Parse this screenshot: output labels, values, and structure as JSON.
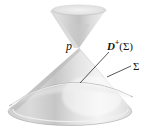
{
  "figure": {
    "type": "spacetime-light-cone",
    "background_color": "#ffffff",
    "width": 156,
    "height": 131
  },
  "labels": {
    "apex_point": "p",
    "domain_of_dependence": {
      "symbol": "D",
      "superscript": "+",
      "open_paren": "(",
      "argument": "Σ",
      "close_paren": ")",
      "full": "D+(Σ)"
    },
    "hypersurface": "Σ"
  },
  "geometry": {
    "apex": {
      "x": 79,
      "y": 48
    },
    "upper_cone": {
      "rim_center_x": 79,
      "rim_center_y": 10,
      "rim_rx": 27,
      "rim_ry": 5
    },
    "lower_cone": {
      "base_center_x": 70,
      "base_center_y": 112,
      "base_rx": 62,
      "base_ry": 14
    },
    "sigma_curve_note": "arc across lower cone interior"
  },
  "leader_lines": {
    "dplus_line": {
      "x1": 109,
      "y1": 52,
      "x2": 80,
      "y2": 83
    },
    "sigma_line": {
      "x1": 131,
      "y1": 66,
      "x2": 108,
      "y2": 77
    }
  },
  "colors": {
    "ink": "#16150f",
    "cone_light": "#fbfbfb",
    "cone_mid": "#d2d2d2",
    "cone_dark": "#a9a9a9",
    "outline": "#9a9a9a"
  }
}
